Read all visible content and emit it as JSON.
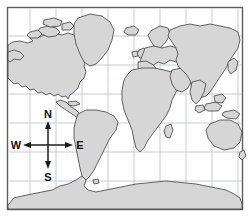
{
  "figure": {
    "name": "world-map-with-compass-rose",
    "type": "map",
    "width": 250,
    "height": 217,
    "background_color": "#ffffff"
  },
  "map": {
    "projection_style": "cylindrical",
    "frame": {
      "x": 7,
      "y": 7,
      "width": 236,
      "height": 203
    },
    "frame_color": "#5d5d5d",
    "ocean_color": "#ffffff",
    "land_fill_color": "#d6d6d6",
    "land_outline_color": "#4a4a4a",
    "graticule": {
      "color": "#b9bcd0",
      "vertical_line_count": 9,
      "horizontal_line_count": 6,
      "vertical_x": [
        30,
        56,
        82,
        108,
        134,
        160,
        186,
        212,
        238
      ],
      "horizontal_y": [
        36,
        65,
        94,
        123,
        152,
        181
      ]
    },
    "landmasses": [
      {
        "name": "north-america"
      },
      {
        "name": "greenland"
      },
      {
        "name": "canadian-arctic-islands"
      },
      {
        "name": "central-america"
      },
      {
        "name": "caribbean-islands"
      },
      {
        "name": "south-america"
      },
      {
        "name": "europe"
      },
      {
        "name": "british-isles"
      },
      {
        "name": "iceland"
      },
      {
        "name": "scandinavia"
      },
      {
        "name": "africa"
      },
      {
        "name": "madagascar"
      },
      {
        "name": "middle-east"
      },
      {
        "name": "asia"
      },
      {
        "name": "india"
      },
      {
        "name": "japan"
      },
      {
        "name": "southeast-asia-islands"
      },
      {
        "name": "new-guinea"
      },
      {
        "name": "australia"
      },
      {
        "name": "new-zealand"
      },
      {
        "name": "antarctica"
      }
    ]
  },
  "compass_rose": {
    "name": "compass-rose",
    "center_x": 48,
    "center_y": 145,
    "arm_length": 26,
    "color": "#1c1c1c",
    "directions": {
      "north": "N",
      "south": "S",
      "east": "E",
      "west": "W"
    }
  }
}
